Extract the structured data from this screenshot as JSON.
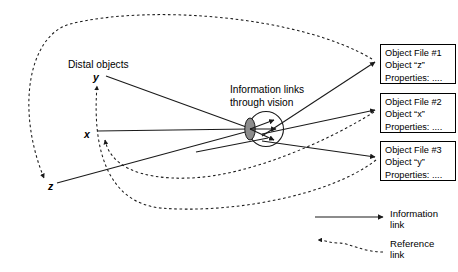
{
  "diagram": {
    "title_labels": {
      "distal_objects": "Distal objects",
      "information_links_line1": "Information links",
      "information_links_line2": "through vision"
    },
    "axis_labels": {
      "y": "y",
      "x": "x",
      "z": "z"
    },
    "object_files": [
      {
        "name": "object-file-1",
        "file_label": "Object File #1",
        "object_label": "Object “z”",
        "properties_label": "Properties: ...."
      },
      {
        "name": "object-file-2",
        "file_label": "Object File #2",
        "object_label": "Object “x”",
        "properties_label": "Properties: ...."
      },
      {
        "name": "object-file-3",
        "file_label": "Object File #3",
        "object_label": "Object “y”",
        "properties_label": "Properties: ...."
      }
    ],
    "legend": {
      "information_link_line1": "Information",
      "information_link_line2": "link",
      "reference_link_line1": "Reference",
      "reference_link_line2": "link"
    },
    "colors": {
      "stroke": "#1a1a1a",
      "lens_fill": "#808080",
      "background": "#ffffff",
      "text": "#000000"
    }
  }
}
